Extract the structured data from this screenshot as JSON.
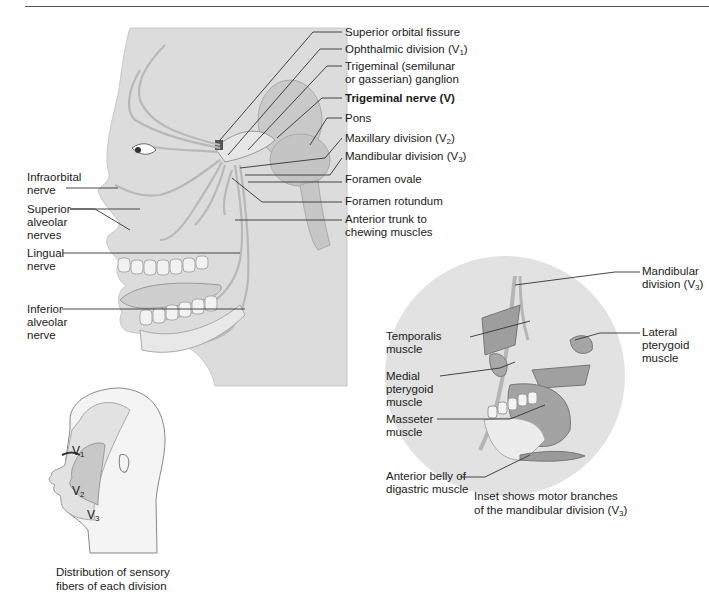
{
  "main_figure": {
    "right_labels": [
      {
        "id": "superior-orbital-fissure",
        "text": "Superior orbital fissure"
      },
      {
        "id": "ophthalmic-division",
        "text": "Ophthalmic division (V",
        "sub": "1",
        "tail": ")"
      },
      {
        "id": "trigeminal-ganglion-1",
        "text": "Trigeminal (semilunar"
      },
      {
        "id": "trigeminal-ganglion-2",
        "text": "or gasserian) ganglion"
      },
      {
        "id": "trigeminal-nerve",
        "text": "Trigeminal nerve (V)"
      },
      {
        "id": "pons",
        "text": "Pons"
      },
      {
        "id": "maxillary-division",
        "text": "Maxillary division (V",
        "sub": "2",
        "tail": ")"
      },
      {
        "id": "mandibular-division",
        "text": "Mandibular division (V",
        "sub": "3",
        "tail": ")"
      },
      {
        "id": "foramen-ovale",
        "text": "Foramen ovale"
      },
      {
        "id": "foramen-rotundum",
        "text": "Foramen rotundum"
      },
      {
        "id": "anterior-trunk-1",
        "text": "Anterior trunk to"
      },
      {
        "id": "anterior-trunk-2",
        "text": "chewing muscles"
      }
    ],
    "left_labels": [
      {
        "id": "infraorbital-nerve",
        "lines": [
          "Infraorbital",
          "nerve"
        ]
      },
      {
        "id": "superior-alveolar-nerves",
        "lines": [
          "Superior",
          "alveolar",
          "nerves"
        ]
      },
      {
        "id": "lingual-nerve",
        "lines": [
          "Lingual",
          "nerve"
        ]
      },
      {
        "id": "inferior-alveolar-nerve",
        "lines": [
          "Inferior",
          "alveolar",
          "nerve"
        ]
      }
    ]
  },
  "inset": {
    "labels": {
      "mandibular_division_1": "Mandibular",
      "mandibular_division_2": "division (V",
      "mandibular_division_sub": "3",
      "mandibular_division_tail": ")",
      "temporalis_1": "Temporalis",
      "temporalis_2": "muscle",
      "lateral_pterygoid_1": "Lateral",
      "lateral_pterygoid_2": "pterygoid",
      "lateral_pterygoid_3": "muscle",
      "medial_pterygoid_1": "Medial",
      "medial_pterygoid_2": "pterygoid",
      "medial_pterygoid_3": "muscle",
      "masseter_1": "Masseter",
      "masseter_2": "muscle",
      "digastric_1": "Anterior belly of",
      "digastric_2": "digastric muscle"
    },
    "caption_1": "Inset shows motor branches",
    "caption_2": "of the mandibular division (V",
    "caption_sub": "3",
    "caption_tail": ")"
  },
  "distribution": {
    "zones": {
      "v1": "V",
      "v1_sub": "1",
      "v2": "V",
      "v2_sub": "2",
      "v3": "V",
      "v3_sub": "3"
    },
    "caption_1": "Distribution of sensory",
    "caption_2": "fibers of each division"
  },
  "colors": {
    "panel": "#dcdcdc",
    "nerve": "#bdbdbd",
    "inset_circle": "#e2e2e2",
    "v2_zone": "#c8c8c8",
    "v1v3_zone": "#e6e6e6"
  }
}
